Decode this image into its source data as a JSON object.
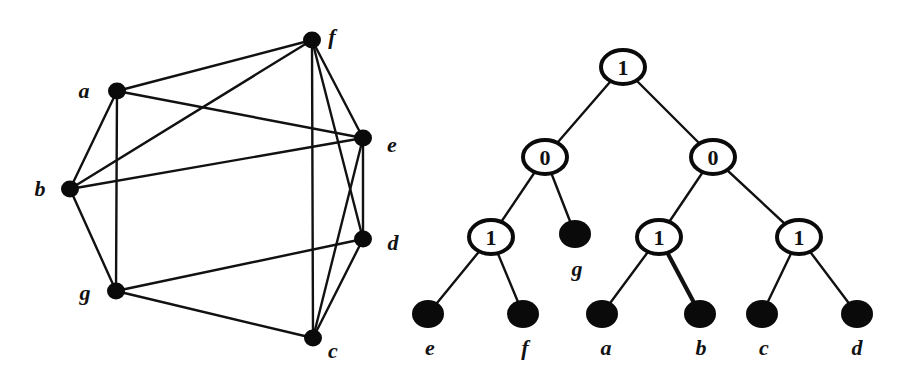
{
  "graph": {
    "nodes": [
      {
        "id": "a",
        "label": "a",
        "x": 117,
        "y": 91,
        "lx": 84,
        "ly": 98
      },
      {
        "id": "b",
        "label": "b",
        "x": 70,
        "y": 189,
        "lx": 40,
        "ly": 196
      },
      {
        "id": "f",
        "label": "f",
        "x": 312,
        "y": 40,
        "lx": 332,
        "ly": 44
      },
      {
        "id": "e",
        "label": "e",
        "x": 363,
        "y": 138,
        "lx": 392,
        "ly": 152
      },
      {
        "id": "d",
        "label": "d",
        "x": 363,
        "y": 239,
        "lx": 393,
        "ly": 250
      },
      {
        "id": "g",
        "label": "g",
        "x": 116,
        "y": 291,
        "lx": 85,
        "ly": 300
      },
      {
        "id": "c",
        "label": "c",
        "x": 313,
        "y": 338,
        "lx": 333,
        "ly": 358
      }
    ],
    "edges": [
      [
        "a",
        "f"
      ],
      [
        "a",
        "e"
      ],
      [
        "a",
        "b"
      ],
      [
        "a",
        "g"
      ],
      [
        "b",
        "f"
      ],
      [
        "b",
        "e"
      ],
      [
        "b",
        "g"
      ],
      [
        "f",
        "c"
      ],
      [
        "f",
        "d"
      ],
      [
        "f",
        "e"
      ],
      [
        "e",
        "d"
      ],
      [
        "e",
        "c"
      ],
      [
        "d",
        "c"
      ],
      [
        "d",
        "g"
      ],
      [
        "g",
        "c"
      ]
    ]
  },
  "tree": {
    "internal_nodes": [
      {
        "id": "r",
        "value": "1",
        "x": 623,
        "y": 67
      },
      {
        "id": "l",
        "value": "0",
        "x": 545,
        "y": 157
      },
      {
        "id": "rt",
        "value": "0",
        "x": 713,
        "y": 157
      },
      {
        "id": "ll",
        "value": "1",
        "x": 491,
        "y": 237
      },
      {
        "id": "rl",
        "value": "1",
        "x": 659,
        "y": 237
      },
      {
        "id": "rr",
        "value": "1",
        "x": 799,
        "y": 237
      }
    ],
    "leaves": [
      {
        "id": "g",
        "label": "g",
        "x": 575,
        "y": 234,
        "lx": 577,
        "ly": 276
      },
      {
        "id": "e",
        "label": "e",
        "x": 428,
        "y": 314,
        "lx": 430,
        "ly": 355
      },
      {
        "id": "f",
        "label": "f",
        "x": 523,
        "y": 314,
        "lx": 525,
        "ly": 355
      },
      {
        "id": "a",
        "label": "a",
        "x": 602,
        "y": 314,
        "lx": 606,
        "ly": 355
      },
      {
        "id": "b",
        "label": "b",
        "x": 700,
        "y": 314,
        "lx": 701,
        "ly": 355
      },
      {
        "id": "c",
        "label": "c",
        "x": 762,
        "y": 314,
        "lx": 764,
        "ly": 355
      },
      {
        "id": "d",
        "label": "d",
        "x": 857,
        "y": 314,
        "lx": 857,
        "ly": 355
      }
    ],
    "edges": [
      {
        "from": "r",
        "to": "l"
      },
      {
        "from": "r",
        "to": "rt"
      },
      {
        "from": "l",
        "to": "ll"
      },
      {
        "from": "l",
        "to": "g"
      },
      {
        "from": "rt",
        "to": "rl"
      },
      {
        "from": "rt",
        "to": "rr"
      },
      {
        "from": "ll",
        "to": "e"
      },
      {
        "from": "ll",
        "to": "f"
      },
      {
        "from": "rl",
        "to": "a"
      },
      {
        "from": "rl",
        "to": "b",
        "thick": true
      },
      {
        "from": "rr",
        "to": "c"
      },
      {
        "from": "rr",
        "to": "d"
      }
    ]
  }
}
